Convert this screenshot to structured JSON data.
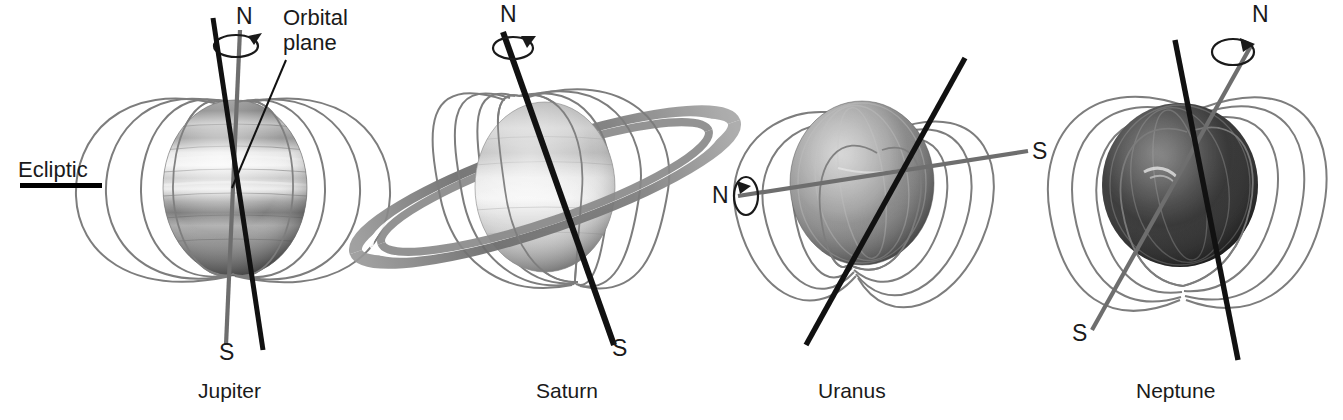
{
  "figure": {
    "background_color": "#ffffff",
    "width": 1343,
    "height": 420
  },
  "annotations": {
    "ecliptic_label": "Ecliptic",
    "orbital_plane_label_line1": "Orbital",
    "orbital_plane_label_line2": "plane"
  },
  "colors": {
    "field_line": "#7d7d7d",
    "magnetic_axis": "#111111",
    "rotation_axis": "#6e6e6e",
    "text": "#1a1a1a",
    "ecliptic_bar": "#000000"
  },
  "legend": {
    "magnetic_axis_style": "thick black line",
    "rotation_axis_style": "thin gray line with circular rotation arrow",
    "field_line_style": "thin gray dipole loops"
  },
  "panels": [
    {
      "id": "jupiter",
      "name": "Jupiter",
      "north_label": "N",
      "south_label": "S",
      "north_label_position": [
        240,
        18
      ],
      "south_label_position": [
        226,
        352
      ],
      "name_label_position": [
        228,
        391
      ],
      "has_rings": false,
      "rotation_axis_color": "#6e6e6e",
      "magnetic_axis_color": "#111111",
      "rotation_arrow": true,
      "rotation_arrow_position": [
        248,
        44
      ],
      "sphere": {
        "cx": 235,
        "cy": 188,
        "rx": 72,
        "ry": 88
      },
      "magnetic_tilt_deg": -10,
      "rotation_tilt_deg": -2,
      "field_loop_count": 5,
      "tilt_note": "magnetic axis offset ~10 degrees from rotation axis"
    },
    {
      "id": "saturn",
      "name": "Saturn",
      "north_label": "N",
      "south_label": "S",
      "north_label_position": [
        504,
        14
      ],
      "south_label_position": [
        616,
        347
      ],
      "name_label_position": [
        568,
        391
      ],
      "has_rings": true,
      "rotation_axis_color": "#111111",
      "magnetic_axis_color": "#111111",
      "rotation_arrow": true,
      "rotation_arrow_position": [
        516,
        44
      ],
      "sphere": {
        "cx": 545,
        "cy": 187,
        "rx": 70,
        "ry": 85
      },
      "magnetic_tilt_deg": 17,
      "rotation_tilt_deg": 17,
      "field_loop_count": 5,
      "tilt_note": "magnetic axis aligned with rotation axis"
    },
    {
      "id": "uranus",
      "name": "Uranus",
      "north_label": "N",
      "south_label": "S",
      "north_label_position": [
        716,
        184
      ],
      "south_label_position": [
        1036,
        140
      ],
      "name_label_position": [
        846,
        391
      ],
      "has_rings": false,
      "rotation_axis_color": "#6e6e6e",
      "magnetic_axis_color": "#111111",
      "rotation_arrow": true,
      "rotation_arrow_position": [
        744,
        197
      ],
      "sphere": {
        "cx": 862,
        "cy": 183,
        "rx": 72,
        "ry": 82
      },
      "magnetic_tilt_deg": 32,
      "rotation_tilt_deg": 84,
      "field_loop_count": 5,
      "tilt_note": "rotation axis lies near the orbital plane; magnetic axis tilted ~59 degrees"
    },
    {
      "id": "neptune",
      "name": "Neptune",
      "north_label": "N",
      "south_label": "S",
      "north_label_position": [
        1256,
        14
      ],
      "south_label_position": [
        1076,
        263
      ],
      "name_label_position": [
        1149,
        391
      ],
      "has_rings": false,
      "rotation_axis_color": "#6e6e6e",
      "magnetic_axis_color": "#111111",
      "rotation_arrow": true,
      "rotation_arrow_position": [
        1240,
        47
      ],
      "sphere": {
        "cx": 1180,
        "cy": 185,
        "rx": 78,
        "ry": 82
      },
      "magnetic_tilt_deg": -8,
      "rotation_tilt_deg": 26,
      "field_loop_count": 5,
      "tilt_note": "magnetic axis tilted ~47 degrees from rotation axis"
    }
  ],
  "ecliptic_marker": {
    "label_position": [
      18,
      158
    ],
    "bar_x": 20,
    "bar_y": 183,
    "bar_width": 82,
    "bar_height": 5
  },
  "orbital_plane_marker": {
    "label_position": [
      283,
      8
    ],
    "leader_from": [
      286,
      60
    ],
    "leader_to": [
      232,
      188
    ]
  }
}
